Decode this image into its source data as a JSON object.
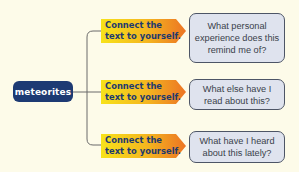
{
  "diagram": {
    "topic": {
      "label": "meteorites",
      "color": "#1d3a73"
    },
    "branches": [
      {
        "prompt": "Connect the text to yourself.",
        "prompt_lines": [
          "Connect the",
          "text to yourself."
        ],
        "question": "What personal experience does this remind me of?"
      },
      {
        "prompt": "Connect the text to yourself.",
        "prompt_lines": [
          "Connect the",
          "text to yourself."
        ],
        "question": "What else have I read about this?"
      },
      {
        "prompt": "Connect the text to yourself.",
        "prompt_lines": [
          "Connect the",
          "text to yourself."
        ],
        "question": "What have I heard about this lately?"
      }
    ],
    "colors": {
      "background": "#fdfbe9",
      "arrow_start": "#f7e21a",
      "arrow_end": "#ec7424",
      "question_fill": "#dfe3ee",
      "question_border": "#4d5566",
      "connector": "#6b6b6b"
    }
  }
}
